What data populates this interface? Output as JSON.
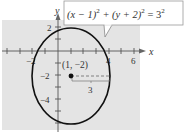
{
  "figure": {
    "equation": {
      "text_parts": [
        "(x − 1)",
        "2",
        " + (y + 2)",
        "2",
        " = 3",
        "2"
      ],
      "full": "(x − 1)^2 + (y + 2)^2 = 3^2"
    },
    "center_label": "(1, −2)",
    "radius_label": "3",
    "axes": {
      "x_label": "x",
      "y_label": "y",
      "x_tick_labels": [
        "−2",
        "4",
        "6"
      ],
      "y_tick_labels": [
        "2",
        "−2",
        "−4"
      ]
    },
    "circle": {
      "center": [
        1,
        -2
      ],
      "radius": 3
    },
    "colors": {
      "background": "#e4e4e4",
      "curve": "#111111",
      "axis": "#555555"
    }
  }
}
